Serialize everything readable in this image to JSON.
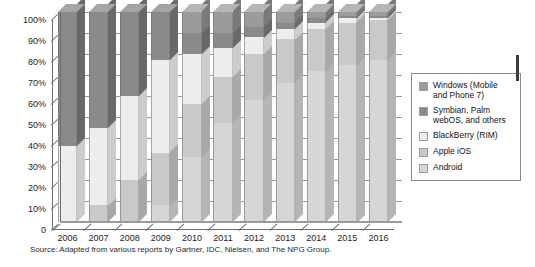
{
  "source_note": "Source: Adapted from various reports by Gartner, IDC, Nielsen, and The NPG Group.",
  "legend": {
    "items": [
      {
        "label": "Windows (Mobile and Phone 7)",
        "color": "#9b9b9b"
      },
      {
        "label": "Symbian, Palm webOS, and others",
        "color": "#8a8a8a"
      },
      {
        "label": "BlackBerry (RIM)",
        "color": "#ededed"
      },
      {
        "label": "Apple iOS",
        "color": "#c9c9c9"
      },
      {
        "label": "Android",
        "color": "#d6d6d6"
      }
    ]
  },
  "axis": {
    "y_ticks": [
      "100%",
      "90%",
      "80%",
      "70%",
      "60%",
      "50%",
      "40%",
      "30%",
      "20%",
      "10%",
      "0"
    ],
    "x_ticks": [
      "2006",
      "2007",
      "2008",
      "2009",
      "2010",
      "2011",
      "2012",
      "2013",
      "2014",
      "2015",
      "2016"
    ]
  },
  "chart_data": {
    "type": "bar",
    "stacked": true,
    "title": "",
    "xlabel": "",
    "ylabel": "",
    "ylim": [
      0,
      100
    ],
    "grid": true,
    "legend_position": "right",
    "categories": [
      "2006",
      "2007",
      "2008",
      "2009",
      "2010",
      "2011",
      "2012",
      "2013",
      "2014",
      "2015",
      "2016"
    ],
    "series": [
      {
        "name": "Android",
        "color": "#d6d6d6",
        "values": [
          0,
          0,
          0,
          8,
          31,
          47,
          58,
          66,
          72,
          75,
          77
        ]
      },
      {
        "name": "Apple iOS",
        "color": "#c9c9c9",
        "values": [
          0,
          8,
          20,
          25,
          25,
          22,
          22,
          21,
          20,
          20,
          19
        ]
      },
      {
        "name": "BlackBerry (RIM)",
        "color": "#ededed",
        "values": [
          36,
          37,
          40,
          44,
          24,
          14,
          8,
          5,
          3,
          2,
          1
        ]
      },
      {
        "name": "Symbian, Palm webOS, and others",
        "color": "#8a8a8a",
        "values": [
          64,
          55,
          40,
          23,
          10,
          7,
          5,
          3,
          2,
          1,
          1
        ]
      },
      {
        "name": "Windows (Mobile and Phone 7)",
        "color": "#9b9b9b",
        "values": [
          0,
          0,
          0,
          0,
          10,
          10,
          7,
          5,
          3,
          2,
          2
        ]
      }
    ]
  }
}
